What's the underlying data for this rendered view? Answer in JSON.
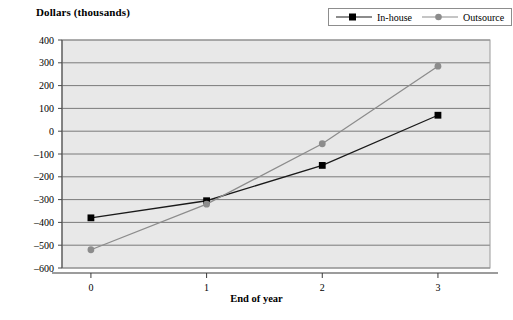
{
  "chart_data": {
    "type": "line",
    "title": "",
    "ylabel": "Dollars (thousands)",
    "xlabel": "End of year",
    "x": [
      0,
      1,
      2,
      3
    ],
    "categories": [
      "0",
      "1",
      "2",
      "3"
    ],
    "xtick_labels": [
      "0",
      "1",
      "2",
      "3"
    ],
    "ytick_labels": [
      "400",
      "300",
      "200",
      "100",
      "0",
      "–100",
      "–200",
      "–300",
      "–400",
      "–500",
      "–600"
    ],
    "ytick_values": [
      400,
      300,
      200,
      100,
      0,
      -100,
      -200,
      -300,
      -400,
      -500,
      -600
    ],
    "ylim": [
      -600,
      400
    ],
    "xlim": [
      -0.25,
      3.45
    ],
    "grid": "horizontal",
    "legend_position": "top-right",
    "plot_background": "#e8e8e8",
    "series": [
      {
        "name": "In-house",
        "color": "#1a1a1a",
        "marker": "square",
        "marker_color": "#000000",
        "values": [
          -380,
          -305,
          -150,
          70
        ]
      },
      {
        "name": "Outsource",
        "color": "#8c8c8c",
        "marker": "circle",
        "marker_color": "#8c8c8c",
        "values": [
          -520,
          -320,
          -55,
          285
        ]
      }
    ]
  },
  "legend": {
    "items": [
      {
        "label": "In-house",
        "marker": "square-marker",
        "color": "#000000",
        "line_color": "#1a1a1a"
      },
      {
        "label": "Outsource",
        "marker": "circle-marker",
        "color": "#8c8c8c",
        "line_color": "#8c8c8c"
      }
    ]
  },
  "axes": {
    "y_axis_title": "Dollars (thousands)",
    "x_axis_title": "End of year"
  }
}
